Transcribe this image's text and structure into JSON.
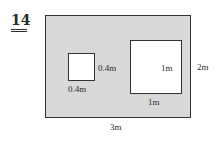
{
  "question_number": "14",
  "figure": {
    "outer_rectangle": {
      "width_label": "3m",
      "height_label": "2m",
      "fill": "#d8d8d8"
    },
    "small_square": {
      "side_label_right": "0.4m",
      "side_label_bottom": "0.4m"
    },
    "large_square": {
      "side_label_inside": "1m",
      "side_label_bottom": "1m"
    }
  }
}
